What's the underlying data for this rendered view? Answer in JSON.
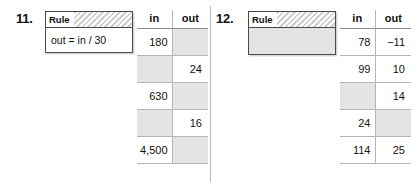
{
  "worksheet": {
    "problems": [
      {
        "number": "11.",
        "rule": {
          "header_label": "Rule",
          "text": "out = in / 30",
          "is_blank": false
        },
        "table": {
          "headers": {
            "in": "in",
            "out": "out"
          },
          "rows": [
            {
              "in": "180",
              "out": ""
            },
            {
              "in": "",
              "out": "24"
            },
            {
              "in": "630",
              "out": ""
            },
            {
              "in": "",
              "out": "16"
            },
            {
              "in": "4,500",
              "out": ""
            }
          ]
        }
      },
      {
        "number": "12.",
        "rule": {
          "header_label": "Rule",
          "text": "",
          "is_blank": true
        },
        "table": {
          "headers": {
            "in": "in",
            "out": "out"
          },
          "rows": [
            {
              "in": "78",
              "out": "−11"
            },
            {
              "in": "99",
              "out": "10"
            },
            {
              "in": "",
              "out": "14"
            },
            {
              "in": "24",
              "out": ""
            },
            {
              "in": "114",
              "out": "25"
            }
          ]
        }
      }
    ]
  },
  "colors": {
    "shaded_cell": "#e4e4e4",
    "rule_border": "#4a4a4a",
    "grid_line": "#b5b5b5",
    "divider": "#b9b9b9",
    "text": "#111111"
  }
}
